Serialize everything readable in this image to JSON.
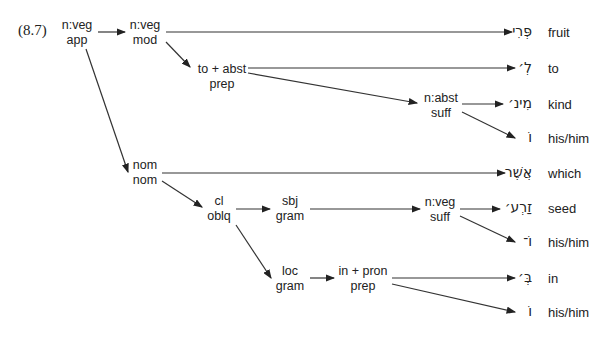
{
  "example_number": "(8.7)",
  "nodes": {
    "app": {
      "l1": "n:veg",
      "l2": "app"
    },
    "mod": {
      "l1": "n:veg",
      "l2": "mod"
    },
    "prep1": {
      "l1": "to + abst",
      "l2": "prep"
    },
    "suff1": {
      "l1": "n:abst",
      "l2": "suff"
    },
    "nom": {
      "l1": "nom",
      "l2": "nom"
    },
    "oblq": {
      "l1": "cl",
      "l2": "oblq"
    },
    "sbj": {
      "l1": "sbj",
      "l2": "gram"
    },
    "suff2": {
      "l1": "n:veg",
      "l2": "suff"
    },
    "loc": {
      "l1": "loc",
      "l2": "gram"
    },
    "prep2": {
      "l1": "in + pron",
      "l2": "prep"
    }
  },
  "leaves": [
    {
      "hebrew": "פְּרִי",
      "gloss": "fruit"
    },
    {
      "hebrew": "לְ׳",
      "gloss": "to"
    },
    {
      "hebrew": "מִינ׳",
      "gloss": "kind"
    },
    {
      "hebrew": "וֹ",
      "gloss": "his/him"
    },
    {
      "hebrew": "אֲשֶׁר",
      "gloss": "which"
    },
    {
      "hebrew": "זַרְע׳",
      "gloss": "seed"
    },
    {
      "hebrew": "וֹ־",
      "gloss": "his/him"
    },
    {
      "hebrew": "בְּ׳",
      "gloss": "in"
    },
    {
      "hebrew": "וֹ",
      "gloss": "his/him"
    }
  ]
}
